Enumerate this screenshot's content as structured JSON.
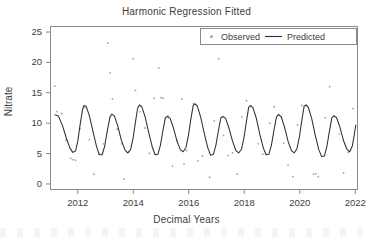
{
  "chart_data": {
    "type": "line",
    "title": "Harmonic Regression Fitted",
    "xlabel": "Decimal Years",
    "ylabel": "Nitrate",
    "xlim": [
      2011.0,
      2022.1
    ],
    "ylim": [
      -1.0,
      26.0
    ],
    "grid": false,
    "legend_position": "top-right",
    "xticks": [
      2012,
      2014,
      2016,
      2018,
      2020,
      2022
    ],
    "xtick_labels": [
      "2012",
      "2014",
      "2016",
      "2018",
      "2020",
      "2022"
    ],
    "yticks": [
      0,
      5,
      10,
      15,
      20,
      25
    ],
    "ytick_labels": [
      "0",
      "5",
      "10",
      "15",
      "20",
      "25"
    ],
    "series": [
      {
        "name": "Observed",
        "type": "scatter",
        "marker": "dot",
        "color": "#a8a8a8",
        "points": [
          [
            2011.17,
            16.1
          ],
          [
            2011.25,
            11.9
          ],
          [
            2011.42,
            11.6
          ],
          [
            2011.58,
            7.2
          ],
          [
            2011.75,
            4.2
          ],
          [
            2011.83,
            4.0
          ],
          [
            2011.92,
            3.9
          ],
          [
            2012.08,
            9.1
          ],
          [
            2012.25,
            12.6
          ],
          [
            2012.42,
            7.3
          ],
          [
            2012.58,
            1.6
          ],
          [
            2012.75,
            5.0
          ],
          [
            2012.92,
            6.6
          ],
          [
            2013.08,
            23.2
          ],
          [
            2013.17,
            18.3
          ],
          [
            2013.25,
            14.0
          ],
          [
            2013.42,
            9.0
          ],
          [
            2013.58,
            6.6
          ],
          [
            2013.67,
            0.8
          ],
          [
            2013.83,
            5.2
          ],
          [
            2014.0,
            20.6
          ],
          [
            2014.08,
            15.4
          ],
          [
            2014.25,
            11.9
          ],
          [
            2014.42,
            9.2
          ],
          [
            2014.58,
            5.0
          ],
          [
            2014.75,
            14.1
          ],
          [
            2014.92,
            19.1
          ],
          [
            2015.0,
            14.2
          ],
          [
            2015.08,
            14.1
          ],
          [
            2015.25,
            11.2
          ],
          [
            2015.42,
            2.9
          ],
          [
            2015.58,
            7.1
          ],
          [
            2015.75,
            14.0
          ],
          [
            2015.83,
            3.3
          ],
          [
            2015.92,
            5.5
          ],
          [
            2016.17,
            13.2
          ],
          [
            2016.33,
            3.8
          ],
          [
            2016.5,
            4.6
          ],
          [
            2016.75,
            1.1
          ],
          [
            2016.92,
            10.4
          ],
          [
            2017.08,
            20.6
          ],
          [
            2017.25,
            8.0
          ],
          [
            2017.42,
            4.7
          ],
          [
            2017.58,
            5.1
          ],
          [
            2017.75,
            1.6
          ],
          [
            2017.92,
            11.0
          ],
          [
            2018.08,
            13.7
          ],
          [
            2018.25,
            12.8
          ],
          [
            2018.5,
            6.6
          ],
          [
            2018.67,
            4.9
          ],
          [
            2018.92,
            10.0
          ],
          [
            2019.08,
            12.7
          ],
          [
            2019.25,
            11.4
          ],
          [
            2019.42,
            6.7
          ],
          [
            2019.58,
            3.1
          ],
          [
            2019.75,
            1.2
          ],
          [
            2019.92,
            9.7
          ],
          [
            2020.08,
            12.9
          ],
          [
            2020.25,
            12.9
          ],
          [
            2020.5,
            1.6
          ],
          [
            2020.58,
            1.7
          ],
          [
            2020.67,
            1.2
          ],
          [
            2020.92,
            10.9
          ],
          [
            2021.08,
            16.0
          ],
          [
            2021.25,
            11.2
          ],
          [
            2021.42,
            8.2
          ],
          [
            2021.58,
            1.8
          ],
          [
            2021.75,
            5.2
          ],
          [
            2021.92,
            12.4
          ]
        ]
      },
      {
        "name": "Predicted",
        "type": "line",
        "color": "#2e2e2e",
        "description": "Annual sinusoidal harmonic fit, peaks ~11.5-13.2, troughs ~4.4-5.6",
        "points": [
          [
            2011.18,
            11.4
          ],
          [
            2011.3,
            11.2
          ],
          [
            2011.45,
            9.6
          ],
          [
            2011.6,
            7.4
          ],
          [
            2011.72,
            5.9
          ],
          [
            2011.82,
            5.2
          ],
          [
            2011.92,
            5.4
          ],
          [
            2012.0,
            7.0
          ],
          [
            2012.08,
            9.6
          ],
          [
            2012.17,
            12.2
          ],
          [
            2012.22,
            12.9
          ],
          [
            2012.3,
            12.8
          ],
          [
            2012.42,
            11.2
          ],
          [
            2012.55,
            8.6
          ],
          [
            2012.68,
            6.1
          ],
          [
            2012.78,
            4.8
          ],
          [
            2012.88,
            4.8
          ],
          [
            2012.97,
            6.2
          ],
          [
            2013.06,
            8.6
          ],
          [
            2013.16,
            11.0
          ],
          [
            2013.23,
            11.5
          ],
          [
            2013.32,
            11.2
          ],
          [
            2013.44,
            9.6
          ],
          [
            2013.57,
            7.2
          ],
          [
            2013.7,
            5.6
          ],
          [
            2013.8,
            5.1
          ],
          [
            2013.9,
            5.6
          ],
          [
            2013.99,
            7.4
          ],
          [
            2014.08,
            10.2
          ],
          [
            2014.16,
            12.5
          ],
          [
            2014.22,
            13.0
          ],
          [
            2014.31,
            12.7
          ],
          [
            2014.43,
            11.0
          ],
          [
            2014.56,
            8.4
          ],
          [
            2014.69,
            6.0
          ],
          [
            2014.79,
            4.8
          ],
          [
            2014.89,
            4.9
          ],
          [
            2014.98,
            6.4
          ],
          [
            2015.07,
            8.8
          ],
          [
            2015.16,
            10.9
          ],
          [
            2015.23,
            11.1
          ],
          [
            2015.33,
            10.8
          ],
          [
            2015.45,
            9.2
          ],
          [
            2015.58,
            7.0
          ],
          [
            2015.7,
            5.6
          ],
          [
            2015.8,
            5.3
          ],
          [
            2015.9,
            6.0
          ],
          [
            2015.99,
            8.0
          ],
          [
            2016.08,
            10.8
          ],
          [
            2016.16,
            12.9
          ],
          [
            2016.22,
            13.2
          ],
          [
            2016.31,
            12.8
          ],
          [
            2016.43,
            11.0
          ],
          [
            2016.56,
            8.3
          ],
          [
            2016.69,
            5.9
          ],
          [
            2016.79,
            4.7
          ],
          [
            2016.89,
            4.9
          ],
          [
            2016.98,
            6.4
          ],
          [
            2017.07,
            8.8
          ],
          [
            2017.16,
            10.9
          ],
          [
            2017.23,
            11.1
          ],
          [
            2017.33,
            10.8
          ],
          [
            2017.45,
            9.2
          ],
          [
            2017.58,
            7.0
          ],
          [
            2017.7,
            5.5
          ],
          [
            2017.8,
            5.1
          ],
          [
            2017.9,
            5.7
          ],
          [
            2017.99,
            7.6
          ],
          [
            2018.08,
            10.3
          ],
          [
            2018.16,
            12.6
          ],
          [
            2018.22,
            12.9
          ],
          [
            2018.31,
            12.6
          ],
          [
            2018.43,
            10.9
          ],
          [
            2018.56,
            8.2
          ],
          [
            2018.69,
            5.9
          ],
          [
            2018.79,
            4.8
          ],
          [
            2018.89,
            4.9
          ],
          [
            2018.98,
            6.4
          ],
          [
            2019.07,
            8.8
          ],
          [
            2019.16,
            11.0
          ],
          [
            2019.23,
            11.4
          ],
          [
            2019.33,
            11.1
          ],
          [
            2019.45,
            9.4
          ],
          [
            2019.58,
            7.0
          ],
          [
            2019.7,
            5.5
          ],
          [
            2019.8,
            5.1
          ],
          [
            2019.9,
            5.8
          ],
          [
            2019.99,
            7.8
          ],
          [
            2020.08,
            10.6
          ],
          [
            2020.16,
            12.8
          ],
          [
            2020.22,
            13.0
          ],
          [
            2020.31,
            12.6
          ],
          [
            2020.43,
            10.8
          ],
          [
            2020.56,
            8.0
          ],
          [
            2020.69,
            5.6
          ],
          [
            2020.79,
            4.5
          ],
          [
            2020.89,
            4.6
          ],
          [
            2020.98,
            6.2
          ],
          [
            2021.07,
            8.7
          ],
          [
            2021.16,
            10.9
          ],
          [
            2021.23,
            11.2
          ],
          [
            2021.33,
            10.9
          ],
          [
            2021.45,
            9.3
          ],
          [
            2021.58,
            7.1
          ],
          [
            2021.7,
            5.7
          ],
          [
            2021.8,
            5.3
          ],
          [
            2021.9,
            6.3
          ],
          [
            2021.97,
            8.2
          ],
          [
            2022.02,
            9.7
          ]
        ]
      }
    ]
  },
  "legend": {
    "observed_label": "Observed",
    "predicted_label": "Predicted"
  },
  "axes": {
    "title": "Harmonic Regression Fitted",
    "xlabel": "Decimal Years",
    "ylabel": "Nitrate"
  },
  "colors": {
    "line": "#2e2e2e",
    "points": "#a8a8a8",
    "frame": "#8a8a8a",
    "text": "#3d3d3d",
    "background": "#ffffff"
  }
}
